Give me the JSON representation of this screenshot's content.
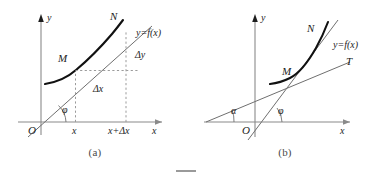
{
  "figure": {
    "background_color": "#ffffff",
    "axis_color": "#8a8a8a",
    "curve_color": "#111111",
    "line_color": "#6f6f6f",
    "dash_color": "#9b9b9b",
    "text_color": "#1d1d1d"
  },
  "panels": [
    {
      "id": "a",
      "caption": "(a)",
      "axes": {
        "x_label": "x",
        "y_label": "y",
        "origin_label": "O"
      },
      "labels": {
        "point_m": "M",
        "point_n": "N",
        "function": "y=f(x)",
        "delta_y": "Δy",
        "delta_x": "Δx",
        "angle_phi": "φ",
        "tick_x": "x",
        "tick_x_plus_dx": "x+Δx"
      }
    },
    {
      "id": "b",
      "caption": "(b)",
      "axes": {
        "x_label": "x",
        "y_label": "y",
        "origin_label": "O"
      },
      "labels": {
        "point_m": "M",
        "point_n": "N",
        "function": "y=f(x)",
        "tangent": "T",
        "angle_alpha": "α",
        "angle_phi": "φ"
      }
    }
  ]
}
